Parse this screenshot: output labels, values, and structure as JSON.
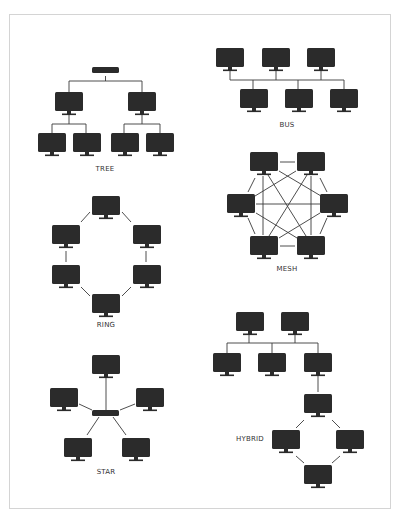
{
  "colors": {
    "device": "#2b2b2b",
    "line": "#3a3a3a",
    "frame": "#d4d4d4",
    "label": "#333333"
  },
  "topologies": [
    {
      "id": "tree",
      "label": "TREE",
      "label_pos": [
        105,
        170
      ]
    },
    {
      "id": "bus",
      "label": "BUS",
      "label_pos": [
        287,
        126
      ]
    },
    {
      "id": "mesh",
      "label": "MESH",
      "label_pos": [
        287,
        270
      ]
    },
    {
      "id": "ring",
      "label": "RING",
      "label_pos": [
        106,
        326
      ]
    },
    {
      "id": "star",
      "label": "STAR",
      "label_pos": [
        106,
        473
      ]
    },
    {
      "id": "hybrid",
      "label": "HYBRID",
      "label_pos": [
        250,
        440
      ]
    }
  ],
  "icons": {
    "computer": "monitor-icon",
    "switch": "network-switch-icon"
  }
}
